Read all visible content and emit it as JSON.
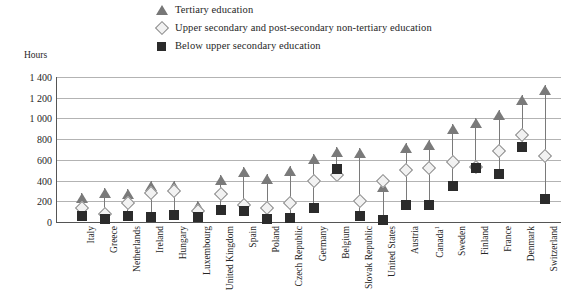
{
  "legend": {
    "items": [
      {
        "marker": "triangle-marker",
        "label": "Tertiary education"
      },
      {
        "marker": "diamond-marker",
        "label": "Upper secondary and post-secondary non-tertiary education"
      },
      {
        "marker": "square-marker",
        "label": "Below upper secondary education"
      }
    ]
  },
  "axis": {
    "y_unit_label": "Hours",
    "y_ticks": [
      "1 400",
      "1 200",
      "1 000",
      "800",
      "600",
      "400",
      "200",
      "0"
    ]
  },
  "chart_data": {
    "type": "scatter",
    "title": "",
    "subtitle": "",
    "xlabel": "",
    "ylabel": "Hours",
    "ylim": [
      0,
      1400
    ],
    "ytick_values": [
      0,
      200,
      400,
      600,
      800,
      1000,
      1200,
      1400
    ],
    "ytick_labels": [
      "0",
      "200",
      "400",
      "600",
      "800",
      "1 000",
      "1 200",
      "1 400"
    ],
    "grid": true,
    "legend_position": "top",
    "categories": [
      "Italy",
      "Greece",
      "Netherlands",
      "Ireland",
      "Hungary",
      "Luxembourg",
      "United Kingdom",
      "Spain",
      "Poland",
      "Czech Republic",
      "Germany",
      "Belgium",
      "Slovak Republic",
      "United States",
      "Austria",
      "Canada",
      "Sweden",
      "Finland",
      "France",
      "Denmark",
      "Switzerland"
    ],
    "category_footnotes": {
      "Canada": "1"
    },
    "series": [
      {
        "name": "Tertiary education",
        "marker": "triangle",
        "values": [
          280,
          330,
          320,
          395,
          400,
          205,
          455,
          530,
          460,
          545,
          655,
          720,
          710,
          390,
          760,
          790,
          950,
          1000,
          1080,
          1230,
          1320
        ]
      },
      {
        "name": "Upper secondary and post-secondary non-tertiary education",
        "marker": "diamond",
        "values": [
          135,
          75,
          185,
          280,
          300,
          110,
          275,
          165,
          135,
          180,
          400,
          455,
          200,
          400,
          505,
          520,
          575,
          530,
          690,
          840,
          640
        ]
      },
      {
        "name": "Below upper secondary education",
        "marker": "square",
        "values": [
          60,
          30,
          60,
          45,
          70,
          45,
          120,
          105,
          30,
          40,
          135,
          515,
          55,
          20,
          165,
          165,
          350,
          525,
          465,
          720,
          225
        ]
      }
    ]
  }
}
